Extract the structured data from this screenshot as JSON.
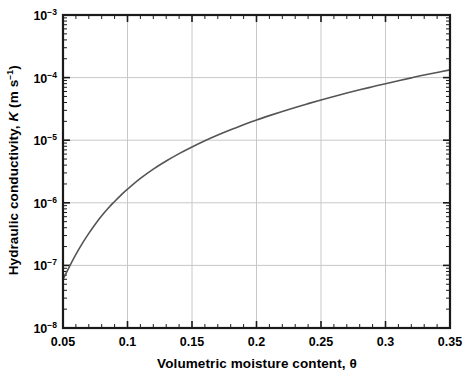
{
  "chart_data": {
    "type": "line",
    "title": "",
    "xlabel": "Volumetric moisture content, θ",
    "ylabel": "Hydraulic conductivity, K (m s⁻¹)",
    "ylabel_parts": {
      "lead": "Hydraulic conductivity, ",
      "symbol": "K",
      "units_open": " (m s",
      "units_exp": "−1",
      "units_close": ")"
    },
    "xscale": "linear",
    "yscale": "log",
    "xlim": [
      0.05,
      0.35
    ],
    "ylim": [
      1e-08,
      0.001
    ],
    "grid": true,
    "grid_color": "#c8c8c8",
    "legend": null,
    "line_color": "#555555",
    "frame_color": "#1a1a1a",
    "xticks": [
      0.05,
      0.1,
      0.15,
      0.2,
      0.25,
      0.3,
      0.35
    ],
    "xtick_labels": [
      "0.05",
      "0.1",
      "0.15",
      "0.2",
      "0.25",
      "0.3",
      "0.35"
    ],
    "xminor_step": 0.01,
    "yticks": [
      0.001,
      0.0001,
      1e-05,
      1e-06,
      1e-07,
      1e-08
    ],
    "ytick_labels": [
      {
        "mantissa": "10",
        "exponent": "−3"
      },
      {
        "mantissa": "10",
        "exponent": "−4"
      },
      {
        "mantissa": "10",
        "exponent": "−5"
      },
      {
        "mantissa": "10",
        "exponent": "−6"
      },
      {
        "mantissa": "10",
        "exponent": "−7"
      },
      {
        "mantissa": "10",
        "exponent": "−8"
      }
    ],
    "series": [
      {
        "name": "K(θ)",
        "x": [
          0.05,
          0.055,
          0.06,
          0.065,
          0.07,
          0.075,
          0.08,
          0.085,
          0.09,
          0.095,
          0.1,
          0.11,
          0.12,
          0.13,
          0.14,
          0.15,
          0.16,
          0.17,
          0.18,
          0.19,
          0.2,
          0.21,
          0.22,
          0.23,
          0.24,
          0.25,
          0.26,
          0.27,
          0.28,
          0.29,
          0.3,
          0.31,
          0.32,
          0.33,
          0.34,
          0.35
        ],
        "y": [
          6e-08,
          9.6e-08,
          1.5e-07,
          2.25e-07,
          3.25e-07,
          4.55e-07,
          6.2e-07,
          8.2e-07,
          1.05e-06,
          1.33e-06,
          1.65e-06,
          2.45e-06,
          3.45e-06,
          4.65e-06,
          6.1e-06,
          7.8e-06,
          9.8e-06,
          1.21e-05,
          1.47e-05,
          1.76e-05,
          2.1e-05,
          2.47e-05,
          2.88e-05,
          3.34e-05,
          3.84e-05,
          4.4e-05,
          5e-05,
          5.66e-05,
          6.38e-05,
          7.15e-05,
          8e-05,
          8.9e-05,
          9.9e-05,
          0.00011,
          0.000121,
          0.000133
        ]
      }
    ],
    "annotations": []
  },
  "figure": {
    "background": "#ffffff",
    "plot_left_px": 63,
    "plot_right_px": 450,
    "plot_top_px": 15,
    "plot_bottom_px": 328
  }
}
